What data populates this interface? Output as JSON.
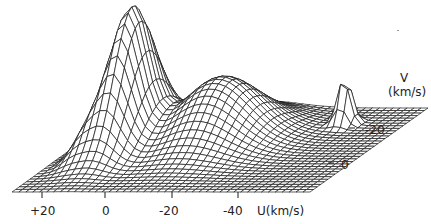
{
  "chart_data": {
    "type": "surface-wireframe",
    "title": "",
    "xlabel": "U(km/s)",
    "ylabel": "V (km/s)",
    "x_ticks": [
      "+20",
      "0",
      "-20",
      "-40"
    ],
    "y_ticks": [
      "-20",
      "0"
    ],
    "x_range": [
      25,
      -50
    ],
    "y_range": [
      10,
      -40
    ],
    "peaks": [
      {
        "name": "main peak",
        "u": 8,
        "v": -10,
        "relative_height": 1.0
      },
      {
        "name": "broad hump",
        "u": -18,
        "v": -20,
        "relative_height": 0.48
      },
      {
        "name": "narrow peak",
        "u": -42,
        "v": -28,
        "relative_height": 0.38
      }
    ],
    "grid": true
  },
  "axes": {
    "x_tick_labels": [
      "+20",
      "0",
      "-20",
      "-40"
    ],
    "x_axis_label": "U(km/s)",
    "y_tick_labels": [
      "-20",
      "0"
    ],
    "y_axis_label_line1": "V",
    "y_axis_label_line2": "(km/s)"
  }
}
